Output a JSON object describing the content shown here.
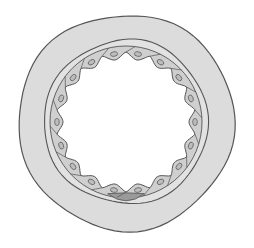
{
  "diagram": {
    "center": [
      126,
      122
    ],
    "layers": [
      {
        "name": "outer-wall",
        "radius": 108,
        "fill": "#dcdcdc"
      },
      {
        "name": "basement-ring",
        "radius": 82,
        "fill": "#e2e2e2"
      },
      {
        "name": "lumen",
        "radius": 67,
        "fill": "#ffffff"
      }
    ],
    "endothelial_cell_count": 18,
    "colors": {
      "stroke": "#555555",
      "wall": "#dcdcdc",
      "cell": "#cfcfcf",
      "nucleus": "#bdbdbd",
      "dark_cell": "#9a9a9a",
      "lumen": "#ffffff"
    }
  }
}
